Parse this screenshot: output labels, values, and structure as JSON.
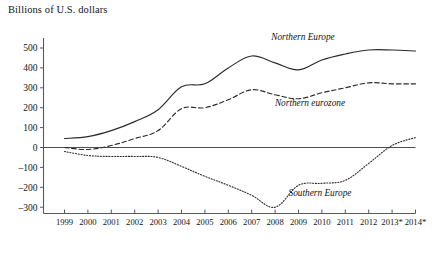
{
  "chart_data": {
    "type": "line",
    "title": "Billions of U.S. dollars",
    "xlabel": "",
    "ylabel": "Billions of U.S. dollars",
    "ylim": [
      -350,
      560
    ],
    "yticks": [
      500,
      400,
      300,
      200,
      100,
      0,
      -100,
      -200,
      -300
    ],
    "ytick_labels": [
      "500",
      "400",
      "300",
      "200",
      "100",
      "0",
      "–100",
      "–200",
      "–300"
    ],
    "grid": false,
    "legend_position": "inline-annotations",
    "zero_line": 0,
    "categories": [
      "1999",
      "2000",
      "2001",
      "2002",
      "2003",
      "2004",
      "2005",
      "2006",
      "2007",
      "2008",
      "2009",
      "2010",
      "2011",
      "2012",
      "2013*",
      "2014*"
    ],
    "series": [
      {
        "name": "Northern Europe",
        "style": "solid",
        "label_x": "2010",
        "values": [
          45,
          55,
          85,
          130,
          190,
          305,
          320,
          400,
          460,
          425,
          390,
          440,
          470,
          490,
          490,
          485
        ]
      },
      {
        "name": "Northern eurozone",
        "style": "dashed",
        "label_x": "2010",
        "values": [
          0,
          -10,
          10,
          45,
          85,
          195,
          200,
          240,
          290,
          265,
          245,
          275,
          300,
          325,
          320,
          320
        ]
      },
      {
        "name": "Southern Europe",
        "style": "dotted",
        "label_x": "2010",
        "values": [
          -20,
          -40,
          -45,
          -45,
          -50,
          -95,
          -145,
          -190,
          -240,
          -300,
          -190,
          -180,
          -165,
          -80,
          10,
          50
        ]
      }
    ],
    "annotations": [
      {
        "text": "Northern Europe",
        "x_px": 303,
        "y_px": 40
      },
      {
        "text": "Northern eurozone",
        "x_px": 310,
        "y_px": 106
      },
      {
        "text": "Southern Europe",
        "x_px": 320,
        "y_px": 196
      }
    ],
    "colors": {
      "ink": "#2b2b2b",
      "axis": "#555a5e",
      "background": "#ffffff"
    },
    "footnote_marker": "*"
  }
}
